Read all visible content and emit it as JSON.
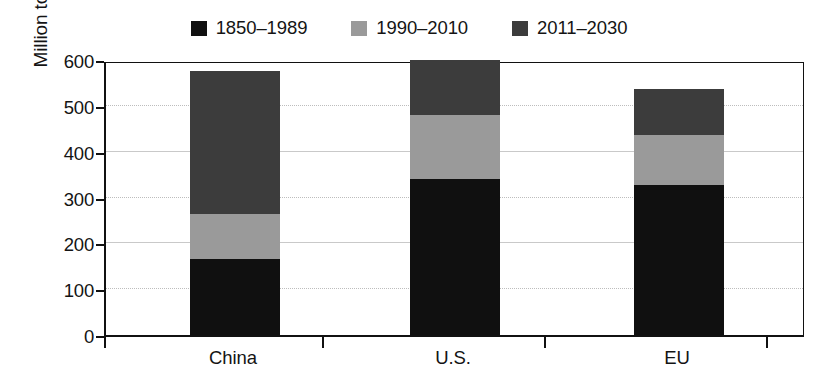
{
  "chart_data": {
    "type": "bar",
    "subtype": "stacked-vertical",
    "title": "",
    "xlabel": "",
    "ylabel": "Million tons CO2 equivalent",
    "ylabel_display": "Million tons CO",
    "ylabel_sub": "2",
    "ylabel_tail": " equivalent",
    "categories": [
      "China",
      "U.S.",
      "EU"
    ],
    "ylim": [
      0,
      600
    ],
    "yticks": [
      0,
      100,
      200,
      300,
      400,
      500,
      600
    ],
    "ytick_labels": [
      "0",
      "100",
      "200",
      "300",
      "400",
      "500",
      "600"
    ],
    "grid": "horizontal",
    "legend_position": "top-center",
    "series": [
      {
        "name": "1850–1989",
        "color": "#101010",
        "values": [
          165,
          340,
          328
        ]
      },
      {
        "name": "1990–2010",
        "color": "#9a9a9a",
        "values": [
          100,
          140,
          109
        ]
      },
      {
        "name": "2011–2030",
        "color": "#3c3c3c",
        "values": [
          310,
          120,
          100
        ]
      }
    ],
    "totals": [
      575,
      600,
      537
    ],
    "annotations": []
  },
  "colors": {
    "axis": "#111111",
    "gridline": "#c9c9c9",
    "background": "#ffffff",
    "text": "#141414"
  }
}
